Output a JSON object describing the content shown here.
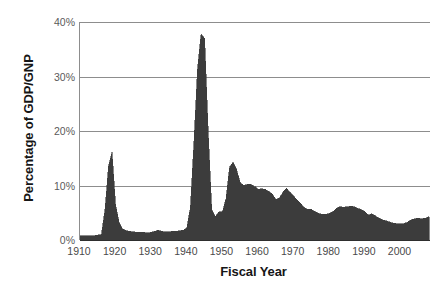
{
  "chart_data": {
    "type": "area",
    "title": "",
    "xlabel": "Fiscal Year",
    "ylabel": "Percentage of GDP/GNP",
    "xlim": [
      1910,
      2008
    ],
    "ylim": [
      0,
      40
    ],
    "grid": true,
    "legend": "none",
    "fill_color": "#3c3c3c",
    "grid_color": "#8d8d8d",
    "axis_color": "#8d8d8d",
    "tick_label_color": "#5a5a5a",
    "y_tick_labels": [
      "0%",
      "10%",
      "20%",
      "30%",
      "40%"
    ],
    "y_tick_values": [
      0,
      10,
      20,
      30,
      40
    ],
    "x_tick_labels": [
      "1910",
      "1920",
      "1930",
      "1940",
      "1950",
      "1960",
      "1970",
      "1980",
      "1990",
      "2000"
    ],
    "x_tick_values": [
      1910,
      1920,
      1930,
      1940,
      1950,
      1960,
      1970,
      1980,
      1990,
      2000
    ],
    "x_minor_tick_step": 1,
    "x": [
      1910,
      1911,
      1912,
      1913,
      1914,
      1915,
      1916,
      1917,
      1918,
      1919,
      1920,
      1921,
      1922,
      1923,
      1924,
      1925,
      1926,
      1927,
      1928,
      1929,
      1930,
      1931,
      1932,
      1933,
      1934,
      1935,
      1936,
      1937,
      1938,
      1939,
      1940,
      1941,
      1942,
      1943,
      1944,
      1945,
      1946,
      1947,
      1948,
      1949,
      1950,
      1951,
      1952,
      1953,
      1954,
      1955,
      1956,
      1957,
      1958,
      1959,
      1960,
      1961,
      1962,
      1963,
      1964,
      1965,
      1966,
      1967,
      1968,
      1969,
      1970,
      1971,
      1972,
      1973,
      1974,
      1975,
      1976,
      1977,
      1978,
      1979,
      1980,
      1981,
      1982,
      1983,
      1984,
      1985,
      1986,
      1987,
      1988,
      1989,
      1990,
      1991,
      1992,
      1993,
      1994,
      1995,
      1996,
      1997,
      1998,
      1999,
      2000,
      2001,
      2002,
      2003,
      2004,
      2005,
      2006,
      2007,
      2008
    ],
    "values": [
      0.8,
      0.8,
      0.8,
      0.8,
      0.8,
      0.9,
      1.0,
      5.5,
      13.5,
      16.1,
      6.4,
      3.2,
      2.0,
      1.7,
      1.6,
      1.5,
      1.4,
      1.4,
      1.4,
      1.3,
      1.4,
      1.6,
      1.8,
      1.6,
      1.5,
      1.5,
      1.6,
      1.6,
      1.7,
      1.8,
      2.2,
      6.0,
      18.0,
      31.5,
      37.8,
      37.0,
      20.0,
      5.6,
      4.3,
      5.2,
      5.2,
      7.6,
      13.4,
      14.3,
      12.9,
      10.5,
      10.0,
      10.2,
      10.2,
      9.8,
      9.3,
      9.4,
      9.3,
      8.9,
      8.5,
      7.4,
      7.7,
      8.8,
      9.5,
      8.7,
      8.1,
      7.3,
      6.7,
      5.9,
      5.6,
      5.6,
      5.2,
      4.9,
      4.7,
      4.7,
      4.9,
      5.2,
      5.8,
      6.1,
      6.0,
      6.1,
      6.2,
      6.1,
      5.8,
      5.6,
      5.2,
      4.6,
      4.8,
      4.4,
      4.0,
      3.7,
      3.5,
      3.3,
      3.1,
      3.0,
      3.0,
      3.0,
      3.3,
      3.7,
      3.9,
      4.0,
      3.9,
      4.0,
      4.3
    ]
  }
}
